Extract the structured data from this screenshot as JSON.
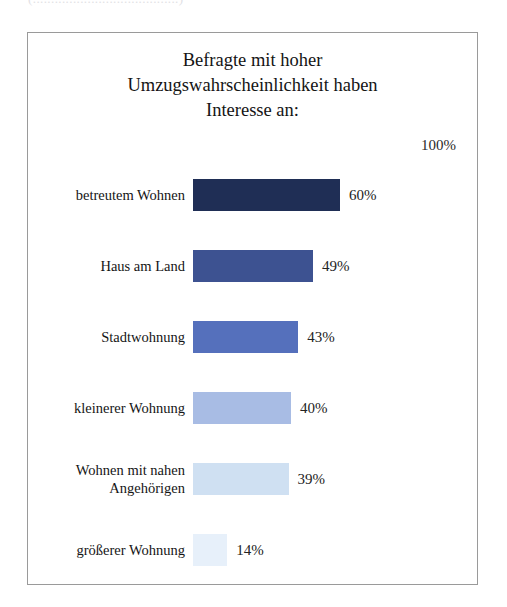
{
  "clipped_top_text": "(........................................)",
  "chart_data": {
    "type": "bar",
    "orientation": "horizontal",
    "title": "Befragte mit hoher Umzugswahrscheinlichkeit haben Interesse an:",
    "title_lines": [
      "Befragte mit hoher",
      "Umzugswahrscheinlichkeit haben",
      "Interesse an:"
    ],
    "xlabel": "",
    "ylabel": "",
    "xlim": [
      0,
      100
    ],
    "grid": false,
    "legend": false,
    "scale_max_label": "100%",
    "categories": [
      "betreutem Wohnen",
      "Haus am Land",
      "Stadtwohnung",
      "kleinerer Wohnung",
      "Wohnen mit nahen Angehörigen",
      "größerer Wohnung"
    ],
    "category_lines": [
      [
        "betreutem Wohnen"
      ],
      [
        "Haus am Land"
      ],
      [
        "Stadtwohnung"
      ],
      [
        "kleinerer Wohnung"
      ],
      [
        "Wohnen mit nahen",
        "Angehörigen"
      ],
      [
        "größerer Wohnung"
      ]
    ],
    "values": [
      60,
      49,
      43,
      40,
      39,
      14
    ],
    "value_labels": [
      "60%",
      "49%",
      "43%",
      "40%",
      "39%",
      "14%"
    ],
    "bar_colors": [
      "#1f2e55",
      "#3d5291",
      "#5570bc",
      "#a8bce4",
      "#cfe0f2",
      "#e7f0fa"
    ]
  }
}
